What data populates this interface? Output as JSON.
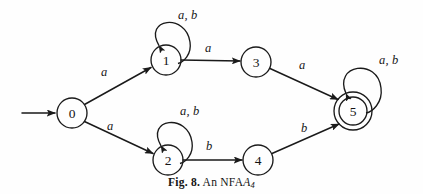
{
  "figure": {
    "caption_prefix": "Fig. 8.",
    "caption_text": "An NFA",
    "caption_automaton": "A",
    "caption_subscript": "4",
    "ink_color": "#1a1a1a",
    "background_color": "#fefefe"
  },
  "automaton": {
    "type": "NFA",
    "name": "A4",
    "alphabet": [
      "a",
      "b"
    ],
    "start_state": "0",
    "accepting_states": [
      "5"
    ],
    "states": [
      {
        "id": "0",
        "label": "0",
        "cx": 72,
        "cy": 113,
        "r": 15,
        "accepting": false,
        "start": true
      },
      {
        "id": "1",
        "label": "1",
        "cx": 166,
        "cy": 60,
        "r": 15,
        "accepting": false,
        "start": false
      },
      {
        "id": "2",
        "label": "2",
        "cx": 168,
        "cy": 160,
        "r": 15,
        "accepting": false,
        "start": false
      },
      {
        "id": "3",
        "label": "3",
        "cx": 256,
        "cy": 62,
        "r": 15,
        "accepting": false,
        "start": false
      },
      {
        "id": "4",
        "label": "4",
        "cx": 258,
        "cy": 160,
        "r": 15,
        "accepting": false,
        "start": false
      },
      {
        "id": "5",
        "label": "5",
        "cx": 353,
        "cy": 111,
        "r": 19,
        "r_inner": 14,
        "accepting": true,
        "start": false
      }
    ],
    "transitions": [
      {
        "id": "t0-1",
        "from": "0",
        "to": "1",
        "label": "a",
        "label_x": 101,
        "label_y": 66
      },
      {
        "id": "t0-2",
        "from": "0",
        "to": "2",
        "label": "a",
        "label_x": 107,
        "label_y": 120
      },
      {
        "id": "t1-1",
        "from": "1",
        "to": "1",
        "label": "a, b",
        "label_x": 178,
        "label_y": 9,
        "self_loop": true
      },
      {
        "id": "t1-3",
        "from": "1",
        "to": "3",
        "label": "a",
        "label_x": 205,
        "label_y": 42
      },
      {
        "id": "t3-5",
        "from": "3",
        "to": "5",
        "label": "a",
        "label_x": 299,
        "label_y": 59
      },
      {
        "id": "t2-2",
        "from": "2",
        "to": "2",
        "label": "a, b",
        "label_x": 180,
        "label_y": 105,
        "self_loop": true
      },
      {
        "id": "t2-4",
        "from": "2",
        "to": "4",
        "label": "b",
        "label_x": 206,
        "label_y": 140
      },
      {
        "id": "t4-5",
        "from": "4",
        "to": "5",
        "label": "b",
        "label_x": 301,
        "label_y": 122
      },
      {
        "id": "t5-5",
        "from": "5",
        "to": "5",
        "label": "a, b",
        "label_x": 379,
        "label_y": 54,
        "self_loop": true
      }
    ],
    "start_arrow": {
      "x1": 22,
      "y1": 113,
      "x2": 55,
      "y2": 113
    }
  }
}
